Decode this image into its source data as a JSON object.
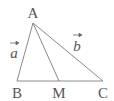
{
  "diagram": {
    "type": "triangle-with-median",
    "colors": {
      "line": "#8a8a8a",
      "text": "#555555",
      "background": "#ffffff"
    },
    "points": {
      "A": {
        "label": "A",
        "x": 33,
        "y": 23
      },
      "B": {
        "label": "B",
        "x": 17,
        "y": 81
      },
      "M": {
        "label": "M",
        "x": 59,
        "y": 81
      },
      "C": {
        "label": "C",
        "x": 103,
        "y": 81
      }
    },
    "segments": [
      {
        "from": "A",
        "to": "B",
        "name": "side-ab"
      },
      {
        "from": "A",
        "to": "C",
        "name": "side-ac"
      },
      {
        "from": "B",
        "to": "C",
        "name": "side-bc"
      },
      {
        "from": "A",
        "to": "M",
        "name": "median-am"
      }
    ],
    "vectors": {
      "a": {
        "label": "a",
        "along": "AB"
      },
      "b": {
        "label": "b",
        "along": "AC"
      }
    }
  }
}
